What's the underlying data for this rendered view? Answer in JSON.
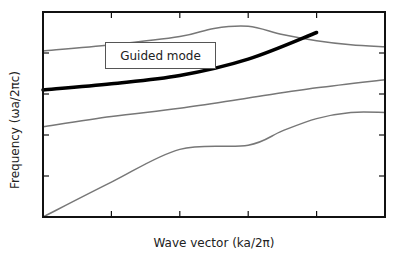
{
  "chart_data": {
    "type": "line",
    "title": "",
    "xlabel": "Wave vector (ka/2π)",
    "ylabel": "Frequency (ωa/2πc)",
    "xlim": [
      0,
      0.5
    ],
    "ylim": [
      0,
      1
    ],
    "x_ticks": [
      0.1,
      0.2,
      0.3,
      0.4
    ],
    "y_ticks": [
      0.2,
      0.4,
      0.6,
      0.8
    ],
    "tick_labels_shown": false,
    "grid": false,
    "legend": null,
    "annotations": [
      {
        "text": "Guided mode",
        "boxed": true,
        "points_to": "guided-mode"
      }
    ],
    "series": [
      {
        "name": "light line / lowest band",
        "color": "#777777",
        "width": 1.5,
        "x": [
          0.0,
          0.1,
          0.2,
          0.3,
          0.35,
          0.4,
          0.45,
          0.5
        ],
        "y": [
          0.0,
          0.17,
          0.33,
          0.35,
          0.42,
          0.48,
          0.51,
          0.51
        ]
      },
      {
        "name": "second band",
        "color": "#777777",
        "width": 1.5,
        "x": [
          0.0,
          0.1,
          0.2,
          0.3,
          0.4,
          0.5
        ],
        "y": [
          0.44,
          0.49,
          0.53,
          0.58,
          0.63,
          0.67
        ]
      },
      {
        "name": "upper band",
        "color": "#777777",
        "width": 1.5,
        "x": [
          0.0,
          0.1,
          0.2,
          0.25,
          0.3,
          0.35,
          0.4,
          0.45,
          0.5
        ],
        "y": [
          0.81,
          0.84,
          0.88,
          0.92,
          0.93,
          0.89,
          0.86,
          0.84,
          0.83
        ]
      },
      {
        "name": "Guided mode",
        "color": "#000000",
        "width": 3.5,
        "x": [
          0.0,
          0.1,
          0.2,
          0.3,
          0.4
        ],
        "y": [
          0.62,
          0.65,
          0.69,
          0.77,
          0.9
        ]
      }
    ]
  },
  "labels": {
    "xlabel": "Wave vector (ka/2π)",
    "ylabel": "Frequency (ωa/2πc)",
    "annotation": "Guided mode"
  },
  "colors": {
    "axis": "#111111",
    "band": "#777777",
    "guided": "#000000"
  }
}
